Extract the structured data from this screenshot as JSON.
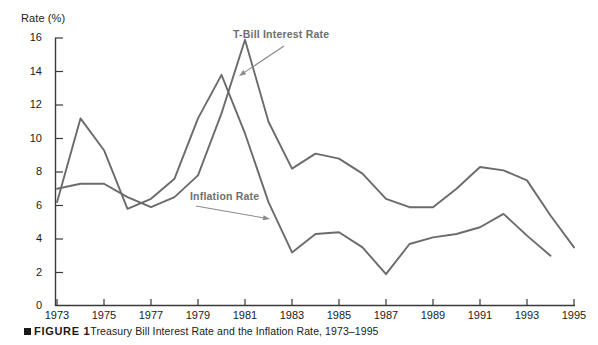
{
  "chart_data": {
    "type": "line",
    "xlabel": "",
    "ylabel": "Rate (%)",
    "ylabel_text": "Rate (%)",
    "xlim": [
      1973,
      1995
    ],
    "ylim": [
      0,
      16
    ],
    "grid": false,
    "legend_position": "inline-annotations",
    "y_ticks": [
      16,
      14,
      12,
      10,
      8,
      6,
      4,
      2,
      0
    ],
    "x_ticks": [
      1973,
      1975,
      1977,
      1979,
      1981,
      1983,
      1985,
      1987,
      1989,
      1991,
      1993,
      1995
    ],
    "x_tick_labels": [
      "1973",
      "1975",
      "1977",
      "1979",
      "1981",
      "1983",
      "1985",
      "1987",
      "1989",
      "1991",
      "1993",
      "1995"
    ],
    "y_tick_labels": [
      "16",
      "14",
      "12",
      "10",
      "8",
      "6",
      "4",
      "2",
      "0"
    ],
    "x_all_years": [
      1973,
      1974,
      1975,
      1976,
      1977,
      1978,
      1979,
      1980,
      1981,
      1982,
      1983,
      1984,
      1985,
      1986,
      1987,
      1988,
      1989,
      1990,
      1991,
      1992,
      1993,
      1994,
      1995
    ],
    "series": [
      {
        "name": "T-Bill Interest Rate",
        "color": "#6b6b6b",
        "x": [
          1973,
          1974,
          1975,
          1976,
          1977,
          1978,
          1979,
          1980,
          1981,
          1982,
          1983,
          1984,
          1985,
          1986,
          1987,
          1988,
          1989,
          1990,
          1991,
          1992,
          1993,
          1994,
          1995
        ],
        "values": [
          7.0,
          7.3,
          7.3,
          6.5,
          5.9,
          6.5,
          7.8,
          11.5,
          15.9,
          11.0,
          8.2,
          9.1,
          8.8,
          7.9,
          6.4,
          5.9,
          5.9,
          7.0,
          8.3,
          8.1,
          7.5,
          5.4,
          3.5
        ]
      },
      {
        "name": "Inflation Rate",
        "color": "#6b6b6b",
        "x": [
          1973,
          1974,
          1975,
          1976,
          1977,
          1978,
          1979,
          1980,
          1981,
          1982,
          1983,
          1984,
          1985,
          1986,
          1987,
          1988,
          1989,
          1990,
          1991,
          1992,
          1993,
          1994
        ],
        "values": [
          6.2,
          11.2,
          9.3,
          5.8,
          6.4,
          7.6,
          11.2,
          13.8,
          10.3,
          6.2,
          3.2,
          4.3,
          4.4,
          3.5,
          1.9,
          3.7,
          4.1,
          4.3,
          4.7,
          5.5,
          4.2,
          3.0
        ]
      }
    ],
    "annotations": [
      {
        "text": "T-Bill Interest Rate",
        "label_x": 233,
        "label_y": 28,
        "arrow_from_x": 284,
        "arrow_from_y": 46,
        "arrow_to_x": 239,
        "arrow_to_y": 76
      },
      {
        "text": "Inflation Rate",
        "label_x": 190,
        "label_y": 190,
        "arrow_from_x": 196,
        "arrow_from_y": 206,
        "arrow_to_x": 270,
        "arrow_to_y": 219
      }
    ]
  },
  "caption": {
    "marker": "square-marker",
    "figure_label": "FIGURE 1",
    "text": "Treasury Bill Interest Rate and the Inflation Rate, 1973–1995"
  },
  "colors": {
    "line": "#6b6b6b",
    "axis": "#3a3a3a",
    "text": "#1a1a1a",
    "annotation_text": "#6e6e6e",
    "background": "#ffffff"
  }
}
